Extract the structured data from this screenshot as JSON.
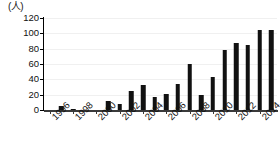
{
  "chart_data": {
    "type": "bar",
    "title": "",
    "subtitle": "",
    "unit_label": "(人)",
    "xlabel": "",
    "ylabel": "",
    "ylim": [
      0,
      120
    ],
    "ytick_values": [
      0,
      20,
      40,
      60,
      80,
      100,
      120
    ],
    "ytick_labels": [
      "0",
      "20",
      "40",
      "60",
      "80",
      "100",
      "120"
    ],
    "grid": true,
    "legend": "none",
    "xtick_labels": [
      "1996",
      "1998",
      "2000",
      "2002",
      "2004",
      "2006",
      "2008",
      "2010",
      "2012",
      "2014"
    ],
    "xtick_step": 2,
    "bar_color": "#111111",
    "axis_color": "#3a3a3a",
    "grid_color": "#f0f0f0",
    "categories": [
      "1996",
      "1997",
      "1998",
      "1999",
      "2000",
      "2001",
      "2002",
      "2003",
      "2004",
      "2005",
      "2006",
      "2007",
      "2008",
      "2009",
      "2010",
      "2011",
      "2012",
      "2013",
      "2014",
      "2015"
    ],
    "values": [
      0,
      5,
      1,
      0,
      0,
      12,
      8,
      25,
      32,
      17,
      21,
      34,
      60,
      20,
      43,
      78,
      88,
      85,
      105,
      105
    ],
    "series": [
      {
        "name": "",
        "values": [
          0,
          5,
          1,
          0,
          0,
          12,
          8,
          25,
          32,
          17,
          21,
          34,
          60,
          20,
          43,
          78,
          88,
          85,
          105,
          105
        ]
      }
    ]
  }
}
